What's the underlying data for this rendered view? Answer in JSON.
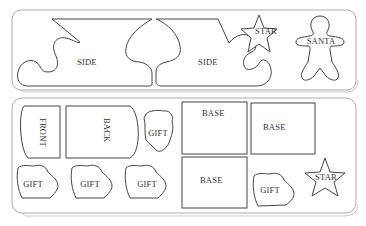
{
  "diagram": {
    "title": "",
    "boards": [
      {
        "id": "board-top",
        "pieces": [
          {
            "type": "side-left",
            "label": "SIDE"
          },
          {
            "type": "side-right",
            "label": "SIDE"
          },
          {
            "type": "star",
            "label": "STAR"
          },
          {
            "type": "gingerbread",
            "label": "SANTA"
          }
        ]
      },
      {
        "id": "board-bottom",
        "pieces": [
          {
            "type": "front",
            "label": "FRONT"
          },
          {
            "type": "back",
            "label": "BACK"
          },
          {
            "type": "gift",
            "label": "GIFT"
          },
          {
            "type": "base",
            "label": "BASE"
          },
          {
            "type": "base",
            "label": "BASE"
          },
          {
            "type": "gift",
            "label": "GIFT"
          },
          {
            "type": "gift",
            "label": "GIFT"
          },
          {
            "type": "gift",
            "label": "GIFT"
          },
          {
            "type": "base",
            "label": "BASE"
          },
          {
            "type": "gift",
            "label": "GIFT"
          },
          {
            "type": "star",
            "label": "STAR"
          }
        ]
      }
    ],
    "colors": {
      "stroke": "#444444",
      "board_edge": "#999999",
      "background": "#ffffff"
    }
  }
}
